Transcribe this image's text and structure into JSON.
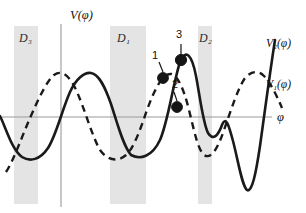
{
  "figure": {
    "type": "potential-energy-diagram",
    "background_color": "#ffffff",
    "axis_color": "#9a9a9a",
    "curve_color": "#1a1a1a",
    "band_color": "#e4e4e4"
  },
  "axes": {
    "y_label": "V(φ)",
    "x_label": "φ",
    "y_axis_x": 61,
    "x_axis_y": 117,
    "grid": false
  },
  "curves": [
    {
      "id": "V2",
      "label": "V₂(φ)",
      "label_base": "V",
      "label_sub": "2",
      "label_tail": "(φ)",
      "style": "solid",
      "label_x": 266,
      "label_y": 38
    },
    {
      "id": "V1",
      "label": "V₁(φ)",
      "label_base": "V",
      "label_sub": "1",
      "label_tail": "(φ)",
      "style": "dashed",
      "label_x": 266,
      "label_y": 79
    }
  ],
  "domains": [
    {
      "id": "D3",
      "label": "D₃",
      "base": "D",
      "sub": "3",
      "x": 14,
      "width": 24,
      "y": 26,
      "height": 178,
      "label_x": 19,
      "label_y": 38
    },
    {
      "id": "D1",
      "label": "D₁",
      "base": "D",
      "sub": "1",
      "x": 110,
      "width": 36,
      "y": 26,
      "height": 178,
      "label_x": 117,
      "label_y": 38
    },
    {
      "id": "D2",
      "label": "D₂",
      "base": "D",
      "sub": "2",
      "x": 198,
      "width": 14,
      "y": 26,
      "height": 178,
      "label_x": 199,
      "label_y": 38
    }
  ],
  "points": [
    {
      "id": "p1",
      "label": "1",
      "cx": 163,
      "cy": 78,
      "r": 5.4,
      "label_x": 152,
      "label_y": 57,
      "on_curve": "crossing"
    },
    {
      "id": "p3",
      "label": "3",
      "cx": 181,
      "cy": 60,
      "r": 5.6,
      "label_x": 176,
      "label_y": 36,
      "on_curve": "V2"
    },
    {
      "id": "p2",
      "label": "2",
      "cx": 177,
      "cy": 107,
      "r": 5.4,
      "label_x": 172,
      "label_y": 86,
      "on_curve": "V1"
    }
  ],
  "chart_data": {
    "type": "line",
    "title": "",
    "xlabel": "φ",
    "ylabel": "V(φ)",
    "grid": false,
    "legend": [
      "V₁(φ)",
      "V₂(φ)"
    ],
    "annotations": [
      "D₃",
      "D₁",
      "D₂",
      "1",
      "2",
      "3"
    ],
    "series": [
      {
        "name": "V₂(φ)",
        "style": "solid",
        "path": "M 0,116 C 6,128 12,150 22,157 C 30,162 40,160 48,148 C 56,136 62,110 70,92 C 76,79 84,72 91,73 C 99,74 105,87 111,104 C 117,122 123,146 131,155 C 140,160 152,157 160,140 C 168,122 173,84 180,62 C 186,48 192,55 196,76 C 200,97 203,123 208,133 C 213,141 218,136 222,125 C 226,115 229,126 233,141 C 238,160 242,186 247,190 C 252,193 256,173 260,146 C 265,110 270,72 275,40"
      },
      {
        "name": "V₁(φ)",
        "style": "dashed",
        "path": "M 6,172 C 14,160 22,136 30,118 C 38,100 46,82 54,75 C 62,69 70,76 77,92 C 85,110 92,136 100,150 C 108,161 118,162 126,155 C 134,148 140,130 147,110 C 155,88 163,73 171,74 C 178,75 184,90 189,110 C 194,130 198,150 204,155 C 211,160 218,148 224,130 C 231,110 238,88 245,78 C 251,71 258,70 264,76 C 270,82 276,94 282,108"
      }
    ]
  }
}
